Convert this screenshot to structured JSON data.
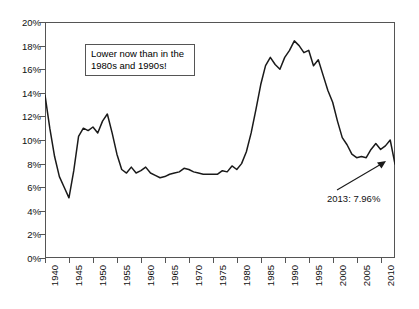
{
  "chart_data": {
    "type": "line",
    "title": "",
    "xlabel": "",
    "ylabel": "",
    "xlim": [
      1940,
      2013
    ],
    "ylim": [
      0,
      20
    ],
    "grid": false,
    "legend": null,
    "y_tick_labels": [
      "0%",
      "2%",
      "4%",
      "6%",
      "8%",
      "10%",
      "12%",
      "14%",
      "16%",
      "18%",
      "20%"
    ],
    "y_tick_values": [
      0,
      2,
      4,
      6,
      8,
      10,
      12,
      14,
      16,
      18,
      20
    ],
    "x_tick_labels": [
      "1940",
      "1945",
      "1950",
      "1955",
      "1960",
      "1965",
      "1970",
      "1975",
      "1980",
      "1985",
      "1990",
      "1995",
      "2000",
      "2005",
      "2010"
    ],
    "x_tick_values": [
      1940,
      1945,
      1950,
      1955,
      1960,
      1965,
      1970,
      1975,
      1980,
      1985,
      1990,
      1995,
      2000,
      2005,
      2010
    ],
    "series": [
      {
        "name": "rate",
        "x": [
          1940,
          1941,
          1942,
          1943,
          1944,
          1945,
          1946,
          1947,
          1948,
          1949,
          1950,
          1951,
          1952,
          1953,
          1954,
          1955,
          1956,
          1957,
          1958,
          1959,
          1960,
          1961,
          1962,
          1963,
          1964,
          1965,
          1966,
          1967,
          1968,
          1969,
          1970,
          1971,
          1972,
          1973,
          1974,
          1975,
          1976,
          1977,
          1978,
          1979,
          1980,
          1981,
          1982,
          1983,
          1984,
          1985,
          1986,
          1987,
          1988,
          1989,
          1990,
          1991,
          1992,
          1993,
          1994,
          1995,
          1996,
          1997,
          1998,
          1999,
          2000,
          2001,
          2002,
          2003,
          2004,
          2005,
          2006,
          2007,
          2008,
          2009,
          2010,
          2011,
          2012,
          2013
        ],
        "values": [
          13.8,
          11.0,
          8.6,
          6.9,
          6.0,
          5.1,
          7.4,
          10.3,
          11.0,
          10.8,
          11.1,
          10.6,
          11.6,
          12.2,
          10.6,
          8.8,
          7.5,
          7.2,
          7.7,
          7.2,
          7.4,
          7.7,
          7.2,
          7.0,
          6.8,
          6.9,
          7.1,
          7.2,
          7.3,
          7.6,
          7.5,
          7.3,
          7.2,
          7.1,
          7.1,
          7.1,
          7.1,
          7.4,
          7.3,
          7.8,
          7.5,
          8.0,
          9.0,
          10.6,
          12.6,
          14.7,
          16.3,
          17.0,
          16.4,
          16.0,
          17.0,
          17.6,
          18.4,
          18.0,
          17.4,
          17.6,
          16.3,
          16.8,
          15.5,
          14.2,
          13.2,
          11.6,
          10.2,
          9.6,
          8.8,
          8.5,
          8.6,
          8.5,
          9.2,
          9.7,
          9.2,
          9.5,
          10.0,
          7.96
        ]
      }
    ],
    "annotations": [
      {
        "name": "callout-box",
        "line1": "Lower now than in the",
        "line2": "1980s and 1990s!"
      },
      {
        "name": "endpoint-label",
        "text": "2013: 7.96%",
        "points_to_year": 2013,
        "points_to_value": 7.96
      }
    ],
    "colors": {
      "line": "#1a1a1a",
      "frame": "#555555",
      "background": "#ffffff",
      "text": "#111111"
    }
  }
}
